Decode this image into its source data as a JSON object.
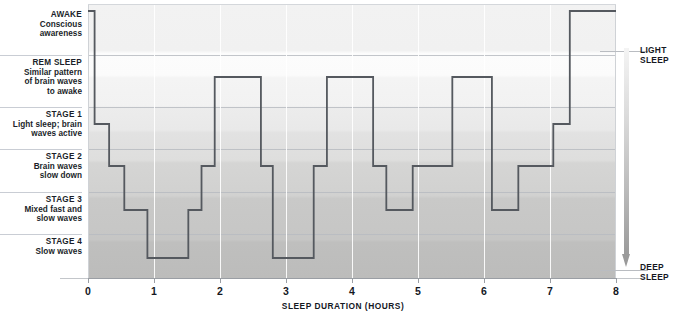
{
  "stage_labels": [
    {
      "title": "AWAKE",
      "desc": "Conscious\nawareness",
      "top": 8,
      "height": 47
    },
    {
      "title": "REM SLEEP",
      "desc": "Similar pattern\nof brain waves\nto awake",
      "top": 55,
      "height": 52
    },
    {
      "title": "STAGE 1",
      "desc": "Light sleep; brain\nwaves active",
      "top": 107,
      "height": 42
    },
    {
      "title": "STAGE 2",
      "desc": "Brain waves\nslow down",
      "top": 149,
      "height": 43
    },
    {
      "title": "STAGE 3",
      "desc": "Mixed fast and\nslow waves",
      "top": 192,
      "height": 42
    },
    {
      "title": "STAGE 4",
      "desc": "Slow waves",
      "top": 234,
      "height": 44
    }
  ],
  "right_labels": {
    "light_sleep": "LIGHT\nSLEEP",
    "deep_sleep": "DEEP\nSLEEP"
  },
  "chart_data": {
    "type": "line",
    "title": "",
    "xlabel": "SLEEP DURATION (HOURS)",
    "ylabel": "",
    "xlim": [
      0,
      8
    ],
    "xticks": [
      0,
      1,
      2,
      3,
      4,
      5,
      6,
      7,
      8
    ],
    "xtick_labels": [
      "0",
      "1",
      "2",
      "3",
      "4",
      "5",
      "6",
      "7",
      "8"
    ],
    "grid": "vertical-at-integer-hours",
    "legend": "none",
    "line_color": "#55595f",
    "line_width": 1.8,
    "y_categories": [
      "AWAKE",
      "REM SLEEP",
      "STAGE 1",
      "STAGE 2",
      "STAGE 3",
      "STAGE 4"
    ],
    "y_level_pixels": {
      "AWAKE": 7,
      "REM": 73,
      "STAGE1": 120,
      "STAGE2": 162,
      "STAGE3": 206,
      "STAGE4": 254
    },
    "band_separators_pixels": [
      51,
      103,
      145,
      188,
      230
    ],
    "steps": [
      {
        "hour_start": 0.0,
        "hour_end": 0.1,
        "stage": "AWAKE"
      },
      {
        "hour_start": 0.1,
        "hour_end": 0.32,
        "stage": "STAGE1"
      },
      {
        "hour_start": 0.32,
        "hour_end": 0.55,
        "stage": "STAGE2"
      },
      {
        "hour_start": 0.55,
        "hour_end": 0.9,
        "stage": "STAGE3"
      },
      {
        "hour_start": 0.9,
        "hour_end": 1.52,
        "stage": "STAGE4"
      },
      {
        "hour_start": 1.52,
        "hour_end": 1.72,
        "stage": "STAGE3"
      },
      {
        "hour_start": 1.72,
        "hour_end": 1.92,
        "stage": "STAGE2"
      },
      {
        "hour_start": 1.92,
        "hour_end": 2.62,
        "stage": "REM"
      },
      {
        "hour_start": 2.62,
        "hour_end": 2.8,
        "stage": "STAGE2"
      },
      {
        "hour_start": 2.8,
        "hour_end": 3.42,
        "stage": "STAGE4"
      },
      {
        "hour_start": 3.42,
        "hour_end": 3.62,
        "stage": "STAGE2"
      },
      {
        "hour_start": 3.62,
        "hour_end": 4.32,
        "stage": "REM"
      },
      {
        "hour_start": 4.32,
        "hour_end": 4.52,
        "stage": "STAGE2"
      },
      {
        "hour_start": 4.52,
        "hour_end": 4.92,
        "stage": "STAGE3"
      },
      {
        "hour_start": 4.92,
        "hour_end": 5.52,
        "stage": "STAGE2"
      },
      {
        "hour_start": 5.52,
        "hour_end": 6.12,
        "stage": "REM"
      },
      {
        "hour_start": 6.12,
        "hour_end": 6.52,
        "stage": "STAGE3"
      },
      {
        "hour_start": 6.52,
        "hour_end": 7.05,
        "stage": "STAGE2"
      },
      {
        "hour_start": 7.05,
        "hour_end": 7.3,
        "stage": "STAGE1"
      },
      {
        "hour_start": 7.3,
        "hour_end": 8.0,
        "stage": "AWAKE"
      }
    ]
  }
}
